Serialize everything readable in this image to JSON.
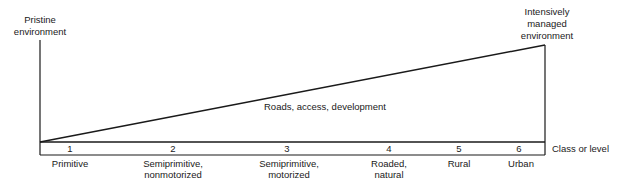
{
  "diagram": {
    "left_endpoint_label": [
      "Pristine",
      "environment"
    ],
    "right_endpoint_label": [
      "Intensively",
      "managed",
      "environment"
    ],
    "slope_label": "Roads, access, development",
    "axis_label": "Class or level",
    "classes": [
      {
        "number": "1",
        "name_line1": "Primitive",
        "name_line2": ""
      },
      {
        "number": "2",
        "name_line1": "Semiprimitive,",
        "name_line2": "nonmotorized"
      },
      {
        "number": "3",
        "name_line1": "Semiprimitive,",
        "name_line2": "motorized"
      },
      {
        "number": "4",
        "name_line1": "Roaded,",
        "name_line2": "natural"
      },
      {
        "number": "5",
        "name_line1": "Rural",
        "name_line2": ""
      },
      {
        "number": "6",
        "name_line1": "Urban",
        "name_line2": ""
      }
    ],
    "line_color": "#1a1a1a"
  }
}
